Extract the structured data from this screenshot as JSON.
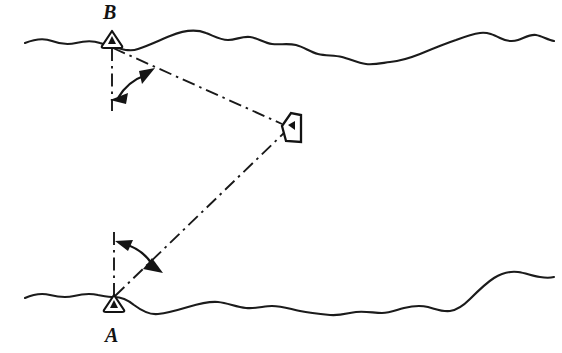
{
  "figure": {
    "width": 562,
    "height": 353,
    "background_color": "#ffffff",
    "ink_color": "#131313"
  },
  "labels": {
    "station_b": "B",
    "station_a": "A"
  },
  "stations": [
    {
      "id": "B",
      "name": "upper-shore-station",
      "label": "B",
      "label_position": "above",
      "marker_type": "triangulation-triangle",
      "marker_x": 112,
      "marker_y": 41,
      "vertex_x": 112,
      "vertex_y": 48,
      "meridian_end_y": 111,
      "angle_label": "",
      "arc_radius": 52
    },
    {
      "id": "A",
      "name": "lower-shore-station",
      "label": "A",
      "label_position": "below",
      "marker_type": "triangulation-triangle",
      "marker_x": 114,
      "marker_y": 303,
      "vertex_x": 114,
      "vertex_y": 295,
      "meridian_end_y": 230,
      "angle_label": "",
      "arc_radius": 48
    }
  ],
  "vessel": {
    "name": "ship-symbol",
    "x": 290,
    "y": 127,
    "heading": "west",
    "symbol": "boat-plan-outline"
  },
  "sight_lines": [
    {
      "name": "sight-line-b-to-vessel",
      "from": "B",
      "to": "vessel",
      "style": "dash-dot"
    },
    {
      "name": "sight-line-a-to-vessel",
      "from": "A",
      "to": "vessel",
      "style": "dash-dot"
    }
  ],
  "meridians": [
    {
      "name": "meridian-reference-b",
      "station": "B",
      "style": "dash-dot",
      "direction": "down"
    },
    {
      "name": "meridian-reference-a",
      "station": "A",
      "style": "dash-dot",
      "direction": "up"
    }
  ],
  "angle_arcs": [
    {
      "name": "angle-arc-b",
      "station": "B",
      "arrowheads": "both-ends",
      "measures": "bearing angle at B"
    },
    {
      "name": "angle-arc-a",
      "station": "A",
      "arrowheads": "both-ends",
      "measures": "bearing angle at A"
    }
  ],
  "shorelines": [
    {
      "name": "upper-shoreline",
      "position": "top",
      "style": "freehand-wavy"
    },
    {
      "name": "lower-shoreline",
      "position": "bottom",
      "style": "freehand-wavy"
    }
  ]
}
